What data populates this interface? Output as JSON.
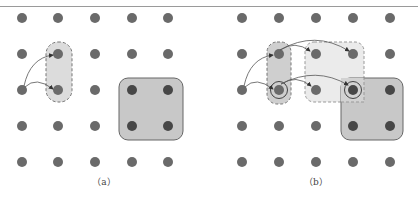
{
  "figure": {
    "panels": [
      {
        "caption": "（a）",
        "grid": {
          "cols_x": [
            22,
            58,
            95,
            132,
            168
          ],
          "rows_y": [
            18,
            54,
            90,
            126,
            162
          ]
        },
        "dashed_region": {
          "x": 46,
          "y": 42,
          "w": 26,
          "h": 60
        },
        "solid_region": {
          "x": 119,
          "y": 78,
          "w": 64,
          "h": 62
        }
      },
      {
        "caption": "（b）",
        "grid": {
          "cols_x": [
            242,
            279,
            316,
            353,
            390
          ],
          "rows_y": [
            18,
            54,
            90,
            126,
            162
          ]
        }
      }
    ],
    "colors": {
      "dot": "#6a6a6a",
      "dot_dark": "#4a4a4a",
      "dashed_fill": "#dcdcdc",
      "light_fill": "#ebebeb",
      "solid_fill": "#c8c8c8",
      "stroke": "#777777"
    }
  }
}
